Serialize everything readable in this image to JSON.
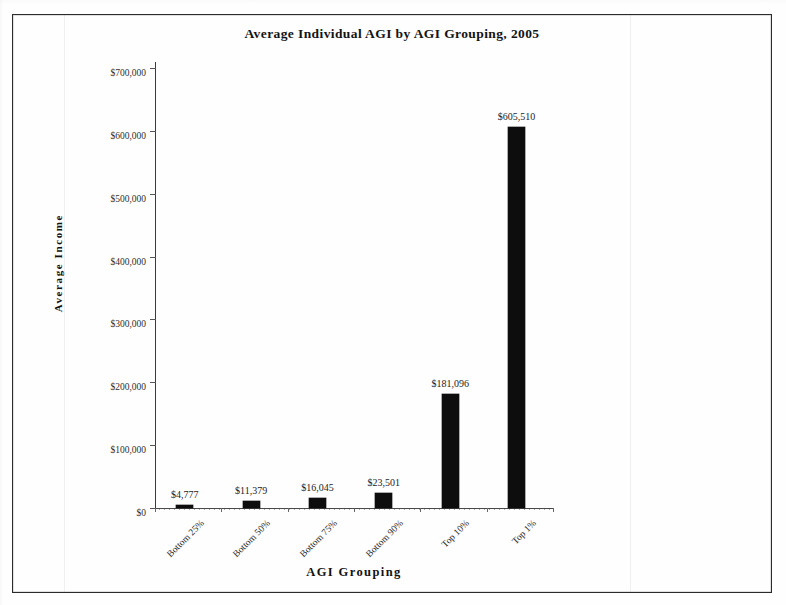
{
  "chart_data": {
    "type": "bar",
    "title": "Average Individual AGI by AGI Grouping, 2005",
    "xlabel": "AGI Grouping",
    "ylabel": "Average Income",
    "categories": [
      "Bottom 25%",
      "Bottom 50%",
      "Bottom 75%",
      "Bottom 90%",
      "Top 10%",
      "Top 1%"
    ],
    "values": [
      4777,
      11379,
      16045,
      23501,
      181096,
      605510
    ],
    "value_labels": [
      "$4,777",
      "$11,379",
      "$16,045",
      "$23,501",
      "$181,096",
      "$605,510"
    ],
    "ylim": [
      0,
      700000
    ],
    "ytick_values": [
      0,
      100000,
      200000,
      300000,
      400000,
      500000,
      600000,
      700000
    ],
    "ytick_labels": [
      "$0",
      "$100,000",
      "$200,000",
      "$300,000",
      "$400,000",
      "$500,000",
      "$600,000",
      "$700,000"
    ],
    "grid": false,
    "legend": false,
    "bar_color": "#0d0d0d",
    "series_name": "Average Income"
  },
  "figure": {
    "border_color": "#2b2b2b",
    "background": "#ffffff"
  }
}
